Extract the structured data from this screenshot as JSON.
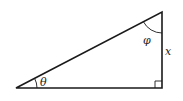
{
  "diagram": {
    "type": "right-triangle",
    "labels": {
      "theta": "θ",
      "phi": "φ",
      "side": "x"
    },
    "stroke_color": "#1a1a1a"
  }
}
